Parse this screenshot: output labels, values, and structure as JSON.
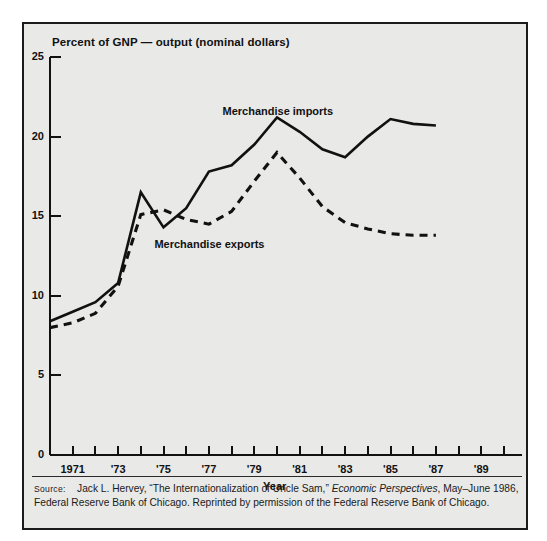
{
  "figure": {
    "axis_title": "Percent of GNP — output (nominal dollars)",
    "xlabel": "Year",
    "source_label": "Source:",
    "source_text_1": "Jack L. Hervey, “The Internationalization of Uncle Sam,” ",
    "source_italic": "Economic Perspectives",
    "source_text_2": ", May–June 1986, Federal Reserve Bank of Chicago. Reprinted by permission of the Federal Reserve Bank of Chicago.",
    "colors": {
      "background": "#e9e9e7",
      "frame": "#1b1b1b",
      "ink": "#111111",
      "series": "#111111"
    }
  },
  "chart_data": {
    "type": "line",
    "title": "Percent of GNP — output (nominal dollars)",
    "xlabel": "Year",
    "ylabel": "Percent of GNP",
    "xlim": [
      1970,
      1990
    ],
    "ylim": [
      0,
      25
    ],
    "ytick_values": [
      0,
      5,
      10,
      15,
      20,
      25
    ],
    "ytick_labels": [
      "0",
      "5",
      "10",
      "15",
      "20",
      "25"
    ],
    "xtick_values": [
      1970,
      1971,
      1972,
      1973,
      1974,
      1975,
      1976,
      1977,
      1978,
      1979,
      1980,
      1981,
      1982,
      1983,
      1984,
      1985,
      1986,
      1987,
      1988,
      1989,
      1990
    ],
    "xtick_labels": [
      "",
      "1971",
      "",
      "'73",
      "",
      "'75",
      "",
      "'77",
      "",
      "'79",
      "",
      "'81",
      "",
      "'83",
      "",
      "'85",
      "",
      "'87",
      "",
      "'89",
      ""
    ],
    "grid": false,
    "legend_position": "inline-annotation",
    "x": [
      1970,
      1971,
      1972,
      1973,
      1974,
      1975,
      1976,
      1977,
      1978,
      1979,
      1980,
      1981,
      1982,
      1983,
      1984,
      1985,
      1986,
      1987
    ],
    "series": [
      {
        "name": "Merchandise imports",
        "style": "solid",
        "annotation": "Merchandise imports",
        "values": [
          8.4,
          9.0,
          9.6,
          10.8,
          16.5,
          14.3,
          15.5,
          17.8,
          18.2,
          19.5,
          21.2,
          20.3,
          19.2,
          18.7,
          20.0,
          21.1,
          20.8,
          20.7
        ]
      },
      {
        "name": "Merchandise exports",
        "style": "dashed",
        "annotation": "Merchandise exports",
        "values": [
          8.0,
          8.3,
          8.9,
          10.6,
          15.1,
          15.4,
          14.8,
          14.5,
          15.3,
          17.2,
          19.0,
          17.4,
          15.6,
          14.6,
          14.2,
          13.9,
          13.8,
          13.8
        ]
      }
    ]
  },
  "annotations": {
    "imports_label": "Merchandise imports",
    "exports_label": "Merchandise exports"
  }
}
